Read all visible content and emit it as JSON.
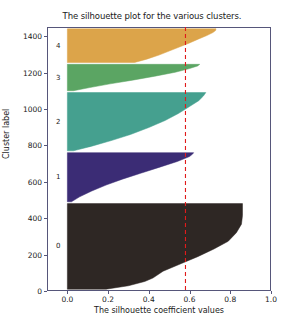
{
  "chart_data": {
    "type": "area",
    "title": "The silhouette plot for the various clusters.",
    "xlabel": "The silhouette coefficient values",
    "ylabel": "Cluster label",
    "xlim": [
      -0.1,
      1.0
    ],
    "ylim": [
      0,
      1450
    ],
    "grid": false,
    "legend": "none",
    "xticks": [
      "0.0",
      "0.2",
      "0.4",
      "0.6",
      "0.8",
      "1.0"
    ],
    "xtick_values": [
      0.0,
      0.2,
      0.4,
      0.6,
      0.8,
      1.0
    ],
    "yticks": [
      "0",
      "200",
      "400",
      "600",
      "800",
      "1000",
      "1200",
      "1400"
    ],
    "ytick_values": [
      0,
      200,
      400,
      600,
      800,
      1000,
      1200,
      1400
    ],
    "average_silhouette_score": 0.58,
    "average_line_color": "#e01b1b",
    "average_line_style": "dashed",
    "clusters": [
      {
        "label": "0",
        "color": "#2e2724",
        "y_start": 10,
        "y_end": 480,
        "label_y": 245,
        "profile": [
          [
            0.0,
            0.19
          ],
          [
            0.04,
            0.3
          ],
          [
            0.09,
            0.38
          ],
          [
            0.13,
            0.42
          ],
          [
            0.21,
            0.47
          ],
          [
            0.3,
            0.56
          ],
          [
            0.38,
            0.64
          ],
          [
            0.47,
            0.72
          ],
          [
            0.56,
            0.79
          ],
          [
            0.66,
            0.83
          ],
          [
            0.76,
            0.855
          ],
          [
            0.86,
            0.86
          ],
          [
            1.0,
            0.86
          ]
        ]
      },
      {
        "label": "1",
        "color": "#3b2c75",
        "y_start": 490,
        "y_end": 760,
        "label_y": 625,
        "profile": [
          [
            0.0,
            0.02
          ],
          [
            0.1,
            0.06
          ],
          [
            0.22,
            0.12
          ],
          [
            0.34,
            0.19
          ],
          [
            0.46,
            0.27
          ],
          [
            0.58,
            0.36
          ],
          [
            0.7,
            0.45
          ],
          [
            0.82,
            0.54
          ],
          [
            0.92,
            0.6
          ],
          [
            0.97,
            0.615
          ],
          [
            1.0,
            0.62
          ]
        ]
      },
      {
        "label": "2",
        "color": "#45a08f",
        "y_start": 770,
        "y_end": 1090,
        "label_y": 930,
        "profile": [
          [
            0.0,
            0.03
          ],
          [
            0.08,
            0.12
          ],
          [
            0.18,
            0.22
          ],
          [
            0.28,
            0.31
          ],
          [
            0.4,
            0.4
          ],
          [
            0.52,
            0.48
          ],
          [
            0.64,
            0.545
          ],
          [
            0.76,
            0.6
          ],
          [
            0.86,
            0.645
          ],
          [
            0.94,
            0.668
          ],
          [
            1.0,
            0.68
          ]
        ]
      },
      {
        "label": "3",
        "color": "#5ba563",
        "y_start": 1100,
        "y_end": 1245,
        "label_y": 1172,
        "profile": [
          [
            0.0,
            0.03
          ],
          [
            0.12,
            0.11
          ],
          [
            0.26,
            0.21
          ],
          [
            0.4,
            0.32
          ],
          [
            0.55,
            0.43
          ],
          [
            0.7,
            0.53
          ],
          [
            0.84,
            0.6
          ],
          [
            0.94,
            0.64
          ],
          [
            1.0,
            0.65
          ]
        ]
      },
      {
        "label": "4",
        "color": "#dca44a",
        "y_start": 1255,
        "y_end": 1440,
        "label_y": 1348,
        "profile": [
          [
            0.0,
            0.33
          ],
          [
            0.1,
            0.39
          ],
          [
            0.22,
            0.45
          ],
          [
            0.34,
            0.5
          ],
          [
            0.46,
            0.55
          ],
          [
            0.58,
            0.6
          ],
          [
            0.7,
            0.645
          ],
          [
            0.8,
            0.685
          ],
          [
            0.89,
            0.715
          ],
          [
            0.95,
            0.728
          ],
          [
            1.0,
            0.73
          ]
        ]
      }
    ]
  }
}
